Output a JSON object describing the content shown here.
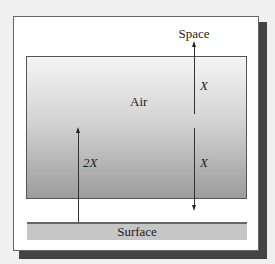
{
  "diagram": {
    "labels": {
      "space": "Space",
      "air": "Air",
      "surface": "Surface",
      "upper_flux": "X",
      "lower_flux": "X",
      "surface_flux": "2X"
    },
    "colors": {
      "frame_shadow": "#444444",
      "air_gradient_top": "#f4f4f4",
      "air_gradient_bottom": "#9c9c9c",
      "surface_fill": "#c6c6c6",
      "arrow": "#222222"
    },
    "arrows": [
      {
        "id": "air-to-space",
        "direction": "up",
        "label": "X"
      },
      {
        "id": "air-to-surface",
        "direction": "down",
        "label": "X"
      },
      {
        "id": "surface-to-air",
        "direction": "up",
        "label": "2X"
      }
    ]
  }
}
